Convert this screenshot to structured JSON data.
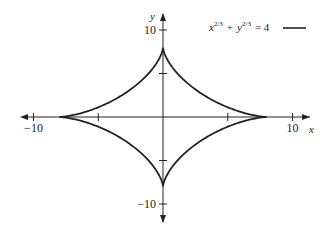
{
  "chart_data": {
    "type": "line",
    "title": "",
    "equation": "x^(2/3) + y^(2/3) = 4",
    "xlabel": "x",
    "ylabel": "y",
    "xlim": [
      -12,
      12
    ],
    "ylim": [
      -12,
      12
    ],
    "x_ticks": [
      -10,
      -5,
      5,
      10
    ],
    "y_ticks": [
      -10,
      -5,
      5,
      10
    ],
    "x_tick_labels": [
      {
        "value": -10,
        "label": "−10"
      },
      {
        "value": 10,
        "label": "10"
      }
    ],
    "y_tick_labels": [
      {
        "value": 10,
        "label": "10"
      },
      {
        "value": -10,
        "label": "−10"
      }
    ],
    "grid": false,
    "legend_placement": "top-right",
    "series": [
      {
        "name": "x^(2/3) + y^(2/3) = 4",
        "curve": "astroid",
        "radius": 8,
        "cusps": [
          [
            8,
            0
          ],
          [
            0,
            8
          ],
          [
            -8,
            0
          ],
          [
            0,
            -8
          ]
        ],
        "color": "#222222"
      }
    ]
  },
  "legend": {
    "x_base": "x",
    "y_base": "y",
    "exponent": "2/3",
    "plus": "+",
    "equals_rhs": "= 4"
  }
}
